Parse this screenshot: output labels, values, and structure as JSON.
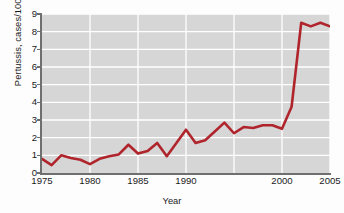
{
  "chart_data": {
    "type": "line",
    "title": "",
    "xlabel": "Year",
    "ylabel": "Pertussis, cases/100,000",
    "xlim": [
      1975,
      2005
    ],
    "ylim": [
      0,
      9
    ],
    "grid": true,
    "legend": null,
    "line_color": "#b0252c",
    "plot_background": "#d6d6d6",
    "gridline_color": "#ffffff",
    "y_ticks": [
      0,
      1,
      2,
      3,
      4,
      5,
      6,
      7,
      8,
      9
    ],
    "y_tick_labels": [
      "0",
      "1",
      "2",
      "3",
      "4",
      "5",
      "6",
      "7",
      "8",
      "9"
    ],
    "x_ticks": [
      1975,
      1980,
      1985,
      1990,
      2000,
      2005
    ],
    "x_tick_labels": [
      "1975",
      "1980",
      "1985",
      "1990",
      "2000",
      "2005"
    ],
    "x_gridlines": [
      1980,
      1985,
      1990,
      1995,
      2000,
      2005
    ],
    "series": [
      {
        "name": "Pertussis incidence",
        "x": [
          1975,
          1976,
          1977,
          1978,
          1979,
          1980,
          1981,
          1982,
          1983,
          1984,
          1985,
          1986,
          1987,
          1988,
          1989,
          1990,
          1991,
          1992,
          1993,
          1994,
          1995,
          1996,
          1997,
          1998,
          1999,
          2000,
          2001,
          2002,
          2003,
          2004,
          2005
        ],
        "values": [
          0.8,
          0.45,
          1.0,
          0.85,
          0.75,
          0.5,
          0.8,
          0.95,
          1.05,
          1.6,
          1.1,
          1.25,
          1.7,
          0.95,
          1.7,
          2.45,
          1.7,
          1.85,
          2.35,
          2.85,
          2.25,
          2.6,
          2.55,
          2.7,
          2.7,
          2.5,
          3.75,
          8.5,
          8.3,
          8.5,
          8.3
        ]
      }
    ]
  },
  "axes": {
    "y_title": "Pertussis, cases/100,000",
    "x_title": "Year"
  }
}
